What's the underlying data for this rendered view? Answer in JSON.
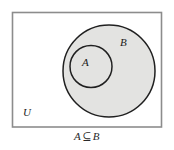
{
  "figure": {
    "type": "venn-diagram",
    "caption": {
      "left_set": "A",
      "operator": "⊆",
      "right_set": "B",
      "full_text": "A ⊆ B"
    },
    "universe": {
      "label": "U",
      "shape": "rectangle",
      "border_color": "#8c8c8c",
      "fill_color": "#ffffff"
    },
    "sets": [
      {
        "label": "B",
        "shape": "circle",
        "cx": 109,
        "cy": 71,
        "r": 46.5,
        "fill_color": "#e3e3e1",
        "border_color": "#1f1f1f",
        "label_x": 124,
        "label_y": 46
      },
      {
        "label": "A",
        "shape": "circle",
        "cx": 91,
        "cy": 66.5,
        "r": 21.5,
        "fill_color": "#e3e3e1",
        "border_color": "#1f1f1f",
        "label_x": 86,
        "label_y": 66
      }
    ],
    "universe_label_x": 23,
    "universe_label_y": 116
  }
}
